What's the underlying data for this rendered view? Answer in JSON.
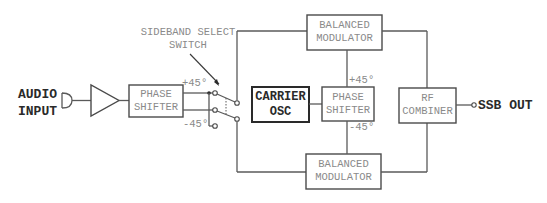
{
  "diagram": {
    "input": {
      "line1": "AUDIO",
      "line2": "INPUT"
    },
    "phase_shifter_audio": {
      "line1": "PHASE",
      "line2": "SHIFTER",
      "plus": "+45°",
      "minus": "-45°"
    },
    "switch": {
      "line1": "SIDEBAND SELECT",
      "line2": "SWITCH"
    },
    "carrier_osc": {
      "line1": "CARRIER",
      "line2": "OSC"
    },
    "phase_shifter_rf": {
      "line1": "PHASE",
      "line2": "SHIFTER",
      "plus": "+45°",
      "minus": "-45°"
    },
    "balanced_modulator_top": {
      "line1": "BALANCED",
      "line2": "MODULATOR"
    },
    "balanced_modulator_bottom": {
      "line1": "BALANCED",
      "line2": "MODULATOR"
    },
    "rf_combiner": {
      "line1": "RF",
      "line2": "COMBINER"
    },
    "output": {
      "label": "SSB OUT"
    },
    "colors": {
      "line": "#5a5a5a",
      "text_light": "#8a8a8a",
      "text_bold": "#2a2a2a"
    }
  }
}
